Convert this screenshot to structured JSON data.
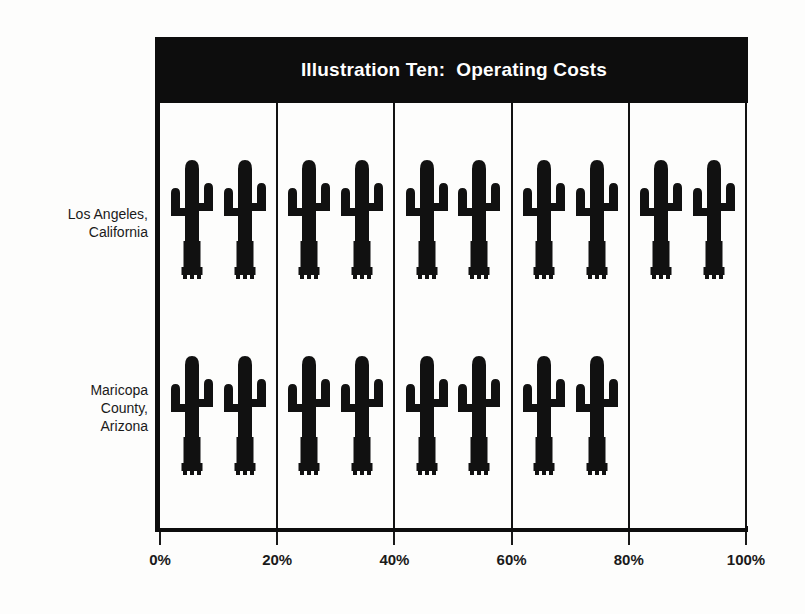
{
  "title": "Illustration Ten:  Operating Costs",
  "colors": {
    "background": "#fdfdfc",
    "title_bar": "#0d0d0d",
    "title_text": "#ffffff",
    "axis": "#0d0d0d",
    "gridline": "#121212",
    "icon": "#111111",
    "label_text": "#1a1a1a"
  },
  "axis": {
    "ticks": [
      {
        "label": "0%",
        "value": 0
      },
      {
        "label": "20%",
        "value": 20
      },
      {
        "label": "40%",
        "value": 40
      },
      {
        "label": "60%",
        "value": 60
      },
      {
        "label": "80%",
        "value": 80
      },
      {
        "label": "100%",
        "value": 100
      }
    ]
  },
  "categories": [
    {
      "label": "Los Angeles,\nCalifornia"
    },
    {
      "label": "Maricopa\nCounty,\nArizona"
    }
  ],
  "icon": {
    "name": "cactus-icon",
    "unit_value": 10,
    "description": "saguaro cactus pictogram, each icon = 10%"
  },
  "chart_data": {
    "type": "bar",
    "subtype": "pictogram",
    "title": "Illustration Ten:  Operating Costs",
    "xlabel": "",
    "ylabel": "",
    "xlim": [
      0,
      100
    ],
    "grid": true,
    "legend": "none",
    "orientation": "horizontal",
    "unit_per_icon": 10,
    "icon_glyph": "cactus",
    "categories": [
      "Los Angeles, California",
      "Maricopa County, Arizona"
    ],
    "values": [
      100,
      80
    ],
    "icon_counts": [
      10,
      8
    ],
    "tick_labels": [
      "0%",
      "20%",
      "40%",
      "60%",
      "80%",
      "100%"
    ],
    "tick_values": [
      0,
      20,
      40,
      60,
      80,
      100
    ]
  }
}
